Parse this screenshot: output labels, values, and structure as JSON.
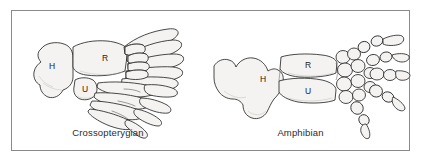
{
  "figure": {
    "frame_border_color": "#8a8a8a",
    "background_color": "#ffffff",
    "bone_fill_color": "#f4f3f1",
    "bone_outline_color": "#1c1c1c",
    "shading_color": "#b9b6b2"
  },
  "panels": [
    {
      "id": "crossopterygian",
      "caption": "Crossopterygian",
      "bone_labels": [
        {
          "key": "H",
          "text": "H",
          "meaning": "humerus",
          "x": 40,
          "y": 55
        },
        {
          "key": "R",
          "text": "R",
          "meaning": "radius",
          "x": 93,
          "y": 48
        },
        {
          "key": "U",
          "text": "U",
          "meaning": "ulna",
          "x": 73,
          "y": 79
        }
      ]
    },
    {
      "id": "amphibian",
      "caption": "Amphibian",
      "bone_labels": [
        {
          "key": "H",
          "text": "H",
          "meaning": "humerus",
          "x": 51,
          "y": 68
        },
        {
          "key": "R",
          "text": "R",
          "meaning": "radius",
          "x": 94,
          "y": 54
        },
        {
          "key": "U",
          "text": "U",
          "meaning": "ulna",
          "x": 94,
          "y": 83
        }
      ]
    }
  ]
}
